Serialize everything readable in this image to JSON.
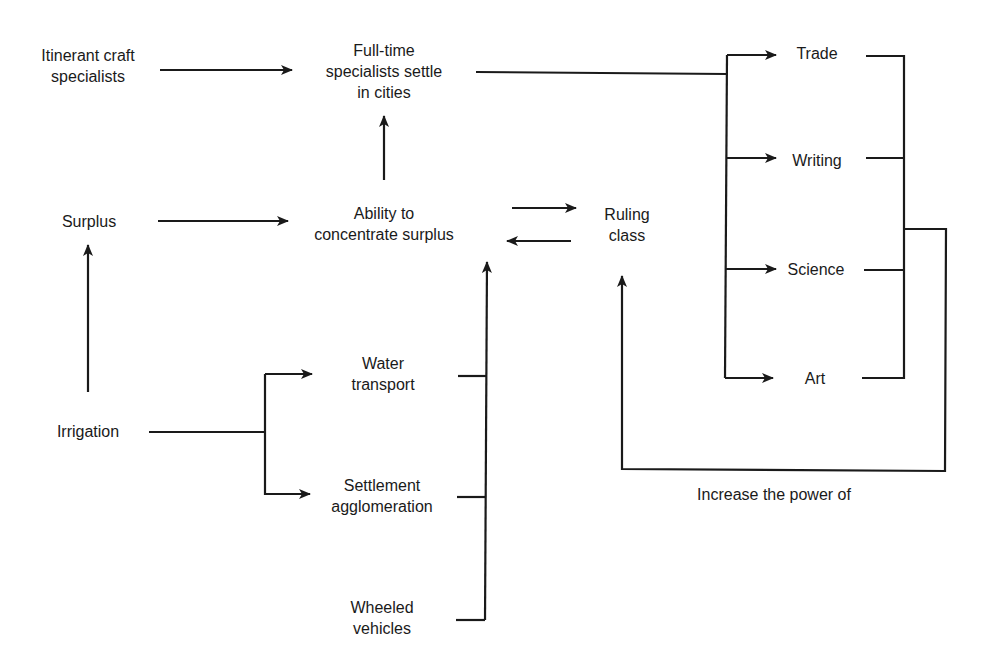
{
  "diagram": {
    "title": "",
    "nodes": {
      "itinerant": {
        "lines": [
          "Itinerant craft",
          "specialists"
        ]
      },
      "fulltime": {
        "lines": [
          "Full-time",
          "specialists settle",
          "in cities"
        ]
      },
      "surplus": {
        "lines": [
          "Surplus"
        ]
      },
      "ability": {
        "lines": [
          "Ability to",
          "concentrate surplus"
        ]
      },
      "ruling": {
        "lines": [
          "Ruling",
          "class"
        ]
      },
      "trade": {
        "lines": [
          "Trade"
        ]
      },
      "writing": {
        "lines": [
          "Writing"
        ]
      },
      "science": {
        "lines": [
          "Science"
        ]
      },
      "art": {
        "lines": [
          "Art"
        ]
      },
      "irrigation": {
        "lines": [
          "Irrigation"
        ]
      },
      "water": {
        "lines": [
          "Water",
          "transport"
        ]
      },
      "settlement": {
        "lines": [
          "Settlement",
          "agglomeration"
        ]
      },
      "wheeled": {
        "lines": [
          "Wheeled",
          "vehicles"
        ]
      }
    },
    "feedback_label": "Increase the power of",
    "edges": [
      {
        "from": "Itinerant craft specialists",
        "to": "Full-time specialists settle in cities"
      },
      {
        "from": "Ability to concentrate surplus",
        "to": "Full-time specialists settle in cities"
      },
      {
        "from": "Surplus",
        "to": "Ability to concentrate surplus"
      },
      {
        "from": "Irrigation",
        "to": "Surplus"
      },
      {
        "from": "Ability to concentrate surplus",
        "to": "Ruling class"
      },
      {
        "from": "Ruling class",
        "to": "Ability to concentrate surplus"
      },
      {
        "from": "Full-time specialists settle in cities",
        "to": [
          "Trade",
          "Writing",
          "Science",
          "Art"
        ]
      },
      {
        "from": [
          "Trade",
          "Writing",
          "Science",
          "Art"
        ],
        "to": "Ruling class",
        "label": "Increase the power of"
      },
      {
        "from": "Irrigation",
        "to": [
          "Water transport",
          "Settlement agglomeration"
        ]
      },
      {
        "from": [
          "Water transport",
          "Settlement agglomeration",
          "Wheeled vehicles"
        ],
        "to": "Ability to concentrate surplus"
      }
    ],
    "colors": {
      "line": "#1a1a1a",
      "background": "#ffffff"
    }
  }
}
